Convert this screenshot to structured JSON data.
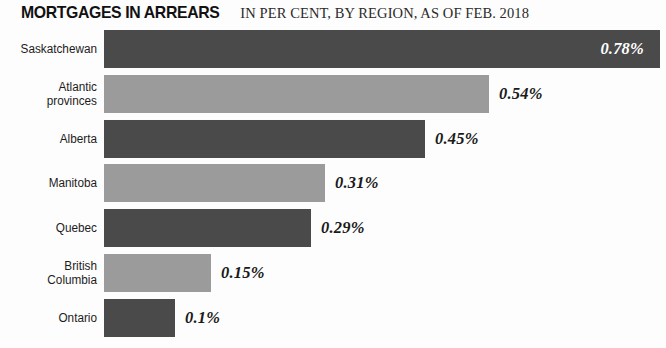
{
  "header": {
    "title": "MORTGAGES IN ARREARS",
    "subtitle": "IN PER CENT, BY REGION, AS OF FEB. 2018"
  },
  "chart_data": {
    "type": "bar",
    "orientation": "horizontal",
    "title": "MORTGAGES IN ARREARS",
    "subtitle": "IN PER CENT, BY REGION, AS OF FEB. 2018",
    "xlabel": "",
    "ylabel": "",
    "unit": "%",
    "grid": false,
    "legend": false,
    "xlim": [
      0,
      0.78
    ],
    "categories": [
      "Saskatchewan",
      "Atlantic provinces",
      "Alberta",
      "Manitoba",
      "Quebec",
      "British Columbia",
      "Ontario"
    ],
    "values": [
      0.78,
      0.54,
      0.45,
      0.31,
      0.29,
      0.15,
      0.1
    ],
    "value_labels": [
      "0.78%",
      "0.54%",
      "0.45%",
      "0.31%",
      "0.29%",
      "0.15%",
      "0.1%"
    ],
    "bar_colors": [
      "#4a4a4a",
      "#9b9b9b",
      "#4a4a4a",
      "#9b9b9b",
      "#4a4a4a",
      "#9b9b9b",
      "#4a4a4a"
    ],
    "label_placement": [
      "inside",
      "outside",
      "outside",
      "outside",
      "outside",
      "outside",
      "outside"
    ]
  },
  "rows": [
    {
      "label_lines": [
        "Saskatchewan"
      ],
      "value_label": "0.78%",
      "value": 0.78,
      "tone": "dark",
      "placement": "inside"
    },
    {
      "label_lines": [
        "Atlantic",
        "provinces"
      ],
      "value_label": "0.54%",
      "value": 0.54,
      "tone": "light",
      "placement": "outside"
    },
    {
      "label_lines": [
        "Alberta"
      ],
      "value_label": "0.45%",
      "value": 0.45,
      "tone": "dark",
      "placement": "outside"
    },
    {
      "label_lines": [
        "Manitoba"
      ],
      "value_label": "0.31%",
      "value": 0.31,
      "tone": "light",
      "placement": "outside"
    },
    {
      "label_lines": [
        "Quebec"
      ],
      "value_label": "0.29%",
      "value": 0.29,
      "tone": "dark",
      "placement": "outside"
    },
    {
      "label_lines": [
        "British",
        "Columbia"
      ],
      "value_label": "0.15%",
      "value": 0.15,
      "tone": "light",
      "placement": "outside"
    },
    {
      "label_lines": [
        "Ontario"
      ],
      "value_label": "0.1%",
      "value": 0.1,
      "tone": "dark",
      "placement": "outside"
    }
  ],
  "layout": {
    "bar_origin_x": 104,
    "px_per_unit": 713,
    "row_pitch": 44.8,
    "bar_height": 38,
    "label_gap": 10,
    "inside_label_pad": 16
  }
}
